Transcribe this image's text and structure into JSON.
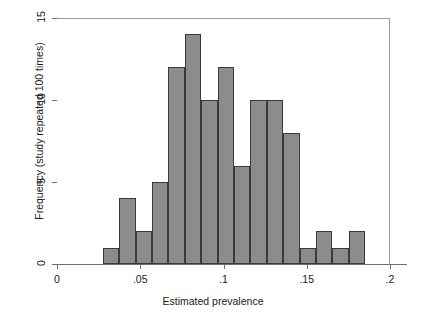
{
  "chart_data": {
    "type": "bar",
    "title": "",
    "xlabel": "Estimated prevalence",
    "ylabel": "Frequency (study repeated 100 times)",
    "xlim": [
      0,
      0.2
    ],
    "ylim": [
      0,
      15
    ],
    "grid": false,
    "legend": null,
    "bin_width": 0.00984,
    "bin_start": 0.0275,
    "bin_edges": [
      0.0275,
      0.0373,
      0.0472,
      0.057,
      0.0669,
      0.0767,
      0.0866,
      0.0964,
      0.1063,
      0.1161,
      0.126,
      0.1358,
      0.1457,
      0.1555,
      0.1654,
      0.1752,
      0.185
    ],
    "bin_centers": [
      0.0324,
      0.0423,
      0.0521,
      0.062,
      0.0718,
      0.0817,
      0.0915,
      0.1014,
      0.1112,
      0.1211,
      0.1309,
      0.1408,
      0.1506,
      0.1605,
      0.1703,
      0.1802
    ],
    "values": [
      1,
      4,
      2,
      5,
      12,
      14,
      10,
      12,
      6,
      10,
      10,
      8,
      1,
      2,
      1,
      2
    ],
    "xticks": [
      0,
      0.05,
      0.1,
      0.15,
      0.2
    ],
    "xticklabels": [
      "0",
      ".05",
      ".1",
      ".15",
      ".2"
    ],
    "yticks": [
      0,
      5,
      10,
      15
    ],
    "yticklabels": [
      "0",
      "5",
      "10",
      "15"
    ],
    "bar_fill_color": "#8c8c8c",
    "bar_edge_color": "#3a3a3a",
    "axis_color": "#6e6e6e",
    "frame_color": "#9a9a9a",
    "background_color": "#ffffff"
  }
}
